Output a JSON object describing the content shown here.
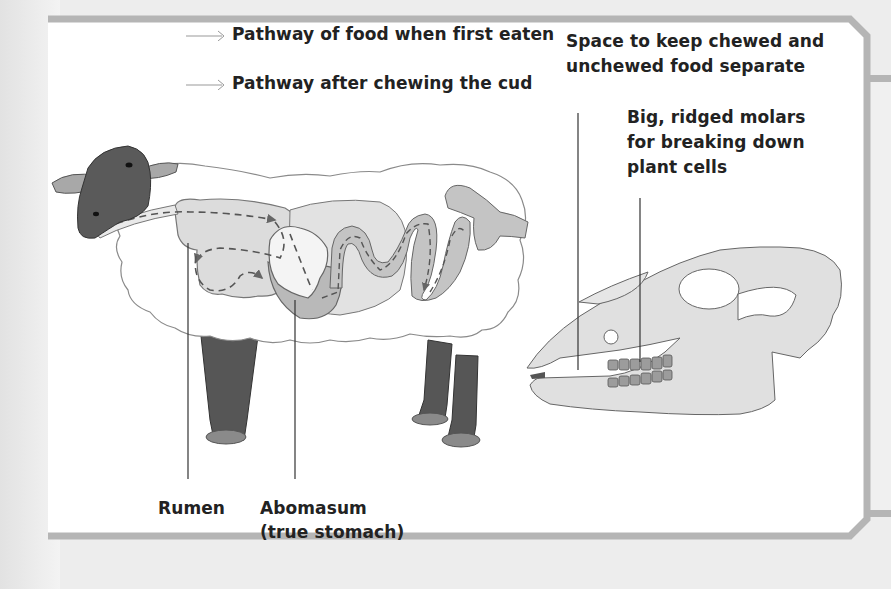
{
  "diagram": {
    "legend": [
      {
        "icon": "thin-arrow-icon",
        "label": "Pathway of food when first eaten"
      },
      {
        "icon": "thin-arrow-icon",
        "label": "Pathway after chewing the cud"
      }
    ],
    "callouts": {
      "space": {
        "line1": "Space to keep chewed and",
        "line2": "unchewed food separate"
      },
      "molars": {
        "line1": "Big, ridged molars",
        "line2": "for breaking down",
        "line3": "plant cells"
      },
      "rumen": {
        "label": "Rumen"
      },
      "abomasum": {
        "line1": "Abomasum",
        "line2": "(true stomach)"
      }
    },
    "colors": {
      "frame": "#b5b5b5",
      "wool": "#ffffff",
      "wool_outline": "#8a8a8a",
      "head_legs": "#5a5a5a",
      "ear_hoof": "#9a9a9a",
      "rumen": "#dcdcdc",
      "abomasum": "#b9b9b9",
      "intestine": "#c4c4c4",
      "skull": "#e0e0e0",
      "teeth": "#9c9c9c"
    }
  }
}
